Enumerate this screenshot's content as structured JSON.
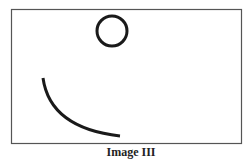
{
  "figure": {
    "caption": "Image III",
    "stroke_color": "#1a1a1a",
    "frame_color": "#555555",
    "frame": {
      "x": 11,
      "y": 9,
      "width": 230,
      "height": 134
    },
    "shapes": [
      {
        "type": "circle",
        "cx": 112,
        "cy": 31,
        "r": 15
      },
      {
        "type": "arc",
        "start": [
          43,
          78
        ],
        "end": [
          120,
          136
        ]
      }
    ]
  }
}
